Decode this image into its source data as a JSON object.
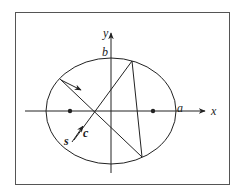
{
  "diagram": {
    "labels": {
      "x_axis": "x",
      "y_axis": "y",
      "semi_major": "a",
      "semi_minor": "b",
      "s": "s",
      "c": "c"
    },
    "colors": {
      "stroke": "#222222",
      "frame": "#555555",
      "background": "#ffffff"
    }
  }
}
